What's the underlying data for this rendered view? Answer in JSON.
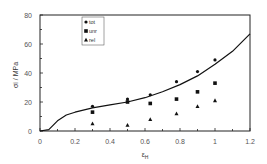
{
  "chart_data": {
    "type": "scatter",
    "title": "",
    "xlabel": "εH",
    "ylabel": "σi / MPa",
    "xlim": [
      0,
      1.2
    ],
    "ylim": [
      0,
      80
    ],
    "x_ticks": [
      "0",
      "0.2",
      "0.4",
      "0.6",
      "0.8",
      "1",
      "1.2"
    ],
    "y_ticks": [
      "0",
      "20",
      "40",
      "60",
      "80"
    ],
    "grid": false,
    "legend_position": "upper-left inside",
    "series": [
      {
        "name": "tot",
        "marker": "circle",
        "x": [
          0.3,
          0.5,
          0.63,
          0.78,
          0.9,
          1.0
        ],
        "y": [
          17,
          22,
          25,
          34,
          41,
          49
        ]
      },
      {
        "name": "unr",
        "marker": "square",
        "x": [
          0.3,
          0.5,
          0.63,
          0.78,
          0.9,
          1.0
        ],
        "y": [
          13,
          20,
          19,
          22,
          27,
          33
        ]
      },
      {
        "name": "rel",
        "marker": "triangle",
        "x": [
          0.3,
          0.5,
          0.63,
          0.78,
          0.9,
          1.0
        ],
        "y": [
          5,
          4,
          8,
          12,
          17,
          21
        ]
      },
      {
        "name": "model curve",
        "type": "line",
        "x": [
          0,
          0.05,
          0.1,
          0.15,
          0.2,
          0.3,
          0.4,
          0.5,
          0.6,
          0.7,
          0.8,
          0.9,
          1.0,
          1.1,
          1.2
        ],
        "y": [
          0,
          1,
          7,
          11,
          13,
          16,
          18,
          20,
          23,
          27,
          32,
          38,
          46,
          55,
          67
        ]
      }
    ]
  },
  "legend": {
    "items": [
      "tot",
      "unr",
      "rel"
    ]
  },
  "axes": {
    "xlabel_main": "ε",
    "xlabel_sub": "H",
    "ylabel": "σi / MPa"
  }
}
